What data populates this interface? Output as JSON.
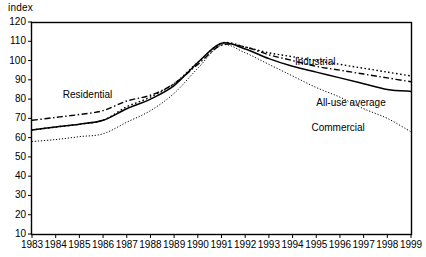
{
  "chart_data": {
    "type": "line",
    "title": "",
    "subtitle": "",
    "ylabel": "index",
    "xlabel": "",
    "ylim": [
      10,
      120
    ],
    "xlim": [
      1983,
      1999
    ],
    "grid": false,
    "legend_position": "inline-annotations",
    "yticks": [
      120,
      110,
      100,
      90,
      80,
      70,
      60,
      50,
      40,
      30,
      20,
      10
    ],
    "x": [
      1983,
      1984,
      1985,
      1986,
      1987,
      1988,
      1989,
      1990,
      1991,
      1992,
      1993,
      1994,
      1995,
      1996,
      1997,
      1998,
      1999
    ],
    "xticklabels": [
      "1983",
      "1984",
      "1985",
      "1986",
      "1987",
      "1988",
      "1989",
      "1990",
      "1991",
      "1992",
      "1993",
      "1994",
      "1995",
      "1996",
      "1997",
      "1998",
      "1999"
    ],
    "series": [
      {
        "name": "Residential",
        "style": "dash-dot",
        "label_x": 1984.3,
        "label_y": 82,
        "values": [
          69,
          70.5,
          72,
          74,
          79,
          82,
          88,
          98,
          108,
          107,
          103,
          100,
          97,
          95,
          93,
          91,
          89
        ]
      },
      {
        "name": "Industrial",
        "style": "dotted",
        "label_x": 1994.1,
        "label_y": 99,
        "values": [
          64,
          65.5,
          67,
          69,
          76,
          81,
          88,
          99,
          109,
          107,
          104,
          102,
          100,
          98,
          96,
          94,
          92
        ]
      },
      {
        "name": "All-use average",
        "style": "solid",
        "label_x": 1995.0,
        "label_y": 78,
        "values": [
          64,
          65.5,
          67,
          69,
          75,
          80,
          87,
          99,
          109,
          106,
          101,
          97,
          94,
          91,
          88,
          85,
          84
        ]
      },
      {
        "name": "Commercial",
        "style": "fine-dotted",
        "label_x": 1994.8,
        "label_y": 65,
        "values": [
          58,
          59,
          60.5,
          62,
          68,
          74,
          83,
          96,
          108,
          104,
          98,
          92,
          86,
          81,
          75,
          70,
          63
        ]
      }
    ]
  }
}
